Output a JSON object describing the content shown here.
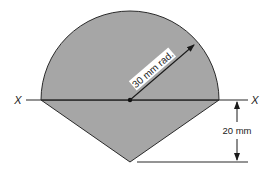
{
  "diagram": {
    "type": "cross-section",
    "colors": {
      "fill": "#a6a6a6",
      "stroke": "#2a2a2a",
      "background": "#ffffff"
    },
    "labels": {
      "axis_left": "X",
      "axis_right": "X",
      "radius": "30 mm rad.",
      "height_dimension": "20 mm"
    },
    "dimensions": {
      "radius_mm": 30,
      "triangle_height_mm": 20
    }
  }
}
